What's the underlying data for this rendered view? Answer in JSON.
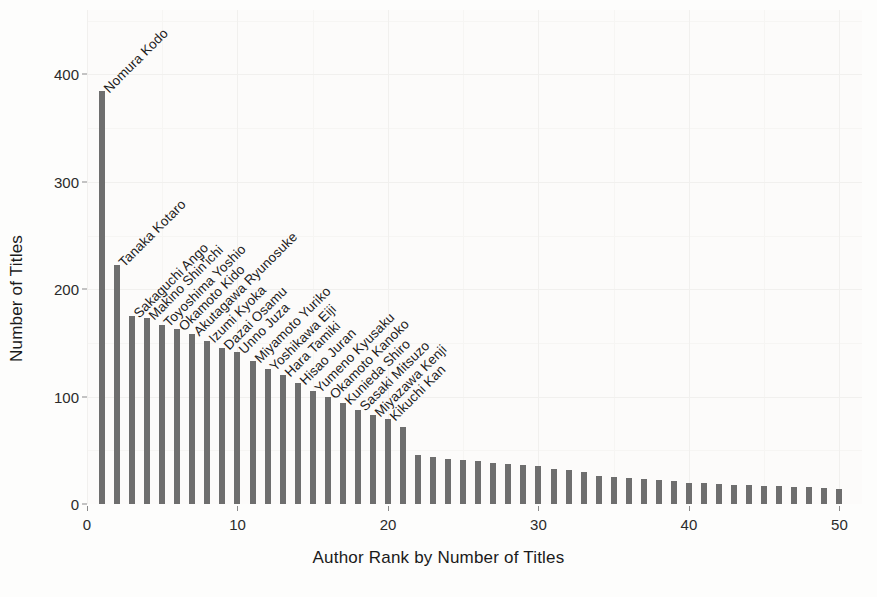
{
  "chart_data": {
    "type": "bar",
    "title": "",
    "xlabel": "Author Rank by Number of Titles",
    "ylabel": "Number of Titles",
    "xlim": [
      0,
      51.5
    ],
    "ylim": [
      0,
      460
    ],
    "xticks": [
      0,
      10,
      20,
      30,
      40,
      50
    ],
    "yticks": [
      0,
      100,
      200,
      300,
      400
    ],
    "grid": true,
    "legend": "none",
    "bar_color": "#6e6e6e",
    "panel_color": "#fcfbfa",
    "categories": [
      1,
      2,
      3,
      4,
      5,
      6,
      7,
      8,
      9,
      10,
      11,
      12,
      13,
      14,
      15,
      16,
      17,
      18,
      19,
      20,
      21,
      22,
      23,
      24,
      25,
      26,
      27,
      28,
      29,
      30,
      31,
      32,
      33,
      34,
      35,
      36,
      37,
      38,
      39,
      40,
      41,
      42,
      43,
      44,
      45,
      46,
      47,
      48,
      49,
      50
    ],
    "values": [
      385,
      223,
      175,
      173,
      167,
      163,
      158,
      152,
      145,
      142,
      133,
      126,
      120,
      113,
      105,
      100,
      94,
      88,
      83,
      79,
      72,
      46,
      44,
      42,
      41,
      40,
      38,
      37,
      36,
      35,
      33,
      32,
      30,
      26,
      25,
      24,
      23,
      22,
      21,
      20,
      20,
      19,
      18,
      18,
      17,
      17,
      16,
      16,
      15,
      14
    ],
    "annotations": [
      {
        "rank": 1,
        "label": "Nomura Kodo",
        "value": 385
      },
      {
        "rank": 2,
        "label": "Tanaka Kotaro",
        "value": 223
      },
      {
        "rank": 3,
        "label": "Sakaguchi Ango",
        "value": 175
      },
      {
        "rank": 4,
        "label": "Makino Shin'ichi",
        "value": 173
      },
      {
        "rank": 5,
        "label": "Toyoshima Yoshio",
        "value": 167
      },
      {
        "rank": 6,
        "label": "Okamoto Kido",
        "value": 163
      },
      {
        "rank": 7,
        "label": "Akutagawa Ryunosuke",
        "value": 158
      },
      {
        "rank": 8,
        "label": "Izumi Kyoka",
        "value": 152
      },
      {
        "rank": 9,
        "label": "Dazai Osamu",
        "value": 145
      },
      {
        "rank": 10,
        "label": "Unno Juza",
        "value": 142
      },
      {
        "rank": 11,
        "label": "Miyamoto Yuriko",
        "value": 133
      },
      {
        "rank": 12,
        "label": "Yoshikawa Eiji",
        "value": 126
      },
      {
        "rank": 13,
        "label": "Hara Tamiki",
        "value": 120
      },
      {
        "rank": 14,
        "label": "Hisao Juran",
        "value": 113
      },
      {
        "rank": 15,
        "label": "Yumeno Kyusaku",
        "value": 105
      },
      {
        "rank": 16,
        "label": "Okamoto Kanoko",
        "value": 100
      },
      {
        "rank": 17,
        "label": "Kunieda Shiro",
        "value": 94
      },
      {
        "rank": 18,
        "label": "Sasaki Mitsuzo",
        "value": 88
      },
      {
        "rank": 19,
        "label": "Miyazawa Kenji",
        "value": 83
      },
      {
        "rank": 20,
        "label": "Kikuchi Kan",
        "value": 79
      }
    ]
  }
}
